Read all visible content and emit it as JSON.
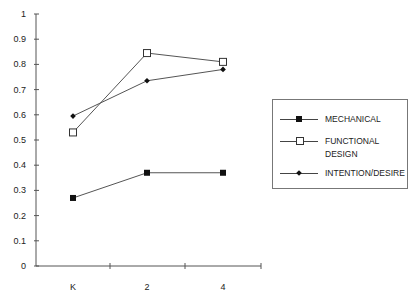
{
  "chart_data": {
    "type": "line",
    "title": "",
    "xlabel": "",
    "ylabel": "",
    "categories": [
      "K",
      "2",
      "4"
    ],
    "ylim": [
      0,
      1
    ],
    "yticks": [
      "0",
      "0.1",
      "0.2",
      "0.3",
      "0.4",
      "0.5",
      "0.6",
      "0.7",
      "0.8",
      "0.9",
      "1"
    ],
    "grid": false,
    "legend_position": "right",
    "series": [
      {
        "name": "MECHANICAL",
        "marker": "filled-square",
        "values": [
          0.27,
          0.37,
          0.37
        ]
      },
      {
        "name": "FUNCTIONAL DESIGN",
        "marker": "open-square",
        "values": [
          0.53,
          0.845,
          0.81
        ]
      },
      {
        "name": "INTENTION/DESIRE",
        "marker": "filled-diamond",
        "values": [
          0.595,
          0.735,
          0.78
        ]
      }
    ]
  },
  "legend": {
    "items": [
      {
        "label": "MECHANICAL"
      },
      {
        "label_line1": "FUNCTIONAL",
        "label_line2": "DESIGN"
      },
      {
        "label": "INTENTION/DESIRE"
      }
    ]
  }
}
